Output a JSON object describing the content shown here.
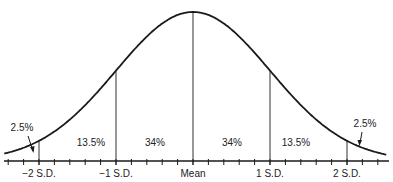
{
  "chart_data": {
    "type": "area",
    "title": "",
    "distribution": "normal",
    "mean": 0,
    "sd": 1,
    "xlim": [
      -2.5,
      2.6
    ],
    "x_ticks": [
      {
        "x": -2,
        "label": "−2 S.D."
      },
      {
        "x": -1,
        "label": "−1 S.D."
      },
      {
        "x": 0,
        "label": "Mean"
      },
      {
        "x": 1,
        "label": "1 S.D."
      },
      {
        "x": 2,
        "label": "2 S.D."
      }
    ],
    "minor_tick_step": 0.2,
    "regions": [
      {
        "from": -3,
        "to": -2,
        "label": "2.5%",
        "arrow": true
      },
      {
        "from": -2,
        "to": -1,
        "label": "13.5%"
      },
      {
        "from": -1,
        "to": 0,
        "label": "34%"
      },
      {
        "from": 0,
        "to": 1,
        "label": "34%"
      },
      {
        "from": 1,
        "to": 2,
        "label": "13.5%"
      },
      {
        "from": 2,
        "to": 3,
        "label": "2.5%",
        "arrow": true
      }
    ],
    "line_color": "#1a1a1a"
  }
}
